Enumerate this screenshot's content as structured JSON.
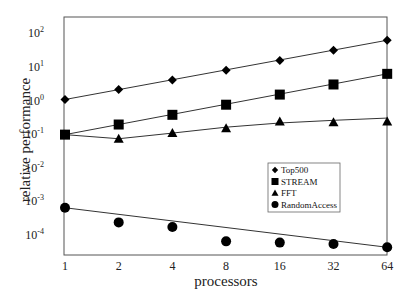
{
  "chart_data": {
    "type": "line",
    "title": "",
    "xlabel": "processors",
    "ylabel": "relative performance",
    "xscale": "log2",
    "yscale": "log10",
    "x": [
      1,
      2,
      4,
      8,
      16,
      32,
      64
    ],
    "x_tick_labels": [
      "1",
      "2",
      "4",
      "8",
      "16",
      "32",
      "64"
    ],
    "ylim": [
      3e-05,
      300
    ],
    "y_ticks": [
      {
        "value": 100,
        "base": "10",
        "exp": "2"
      },
      {
        "value": 10,
        "base": "10",
        "exp": "1"
      },
      {
        "value": 1,
        "base": "10",
        "exp": "0"
      },
      {
        "value": 0.1,
        "base": "10",
        "exp": "-1"
      },
      {
        "value": 0.01,
        "base": "10",
        "exp": "-2"
      },
      {
        "value": 0.001,
        "base": "10",
        "exp": "-3"
      },
      {
        "value": 0.0001,
        "base": "10",
        "exp": "-4"
      }
    ],
    "grid": false,
    "legend_position": "lower-right-inside",
    "series": [
      {
        "name": "Top500",
        "marker": "diamond",
        "values": [
          1.0,
          2.0,
          3.8,
          7.4,
          14.5,
          29,
          58
        ],
        "fit_line": [
          1.0,
          58
        ]
      },
      {
        "name": "STREAM",
        "marker": "square",
        "values": [
          0.09,
          0.18,
          0.35,
          0.7,
          1.4,
          2.8,
          5.8
        ],
        "fit_line": [
          0.09,
          5.8
        ]
      },
      {
        "name": "FFT",
        "marker": "triangle",
        "values": [
          0.09,
          0.068,
          0.1,
          0.14,
          0.22,
          0.21,
          0.22
        ],
        "fit_line": [
          0.09,
          0.068,
          0.1,
          0.15,
          0.2,
          0.24,
          0.28
        ]
      },
      {
        "name": "RandomAccess",
        "marker": "circle",
        "values": [
          0.0006,
          0.00022,
          0.00016,
          6e-05,
          5.5e-05,
          5e-05,
          4e-05
        ],
        "fit_line": [
          0.0006,
          4e-05
        ]
      }
    ]
  },
  "legend": {
    "items": [
      "Top500",
      "STREAM",
      "FFT",
      "RandomAccess"
    ]
  }
}
